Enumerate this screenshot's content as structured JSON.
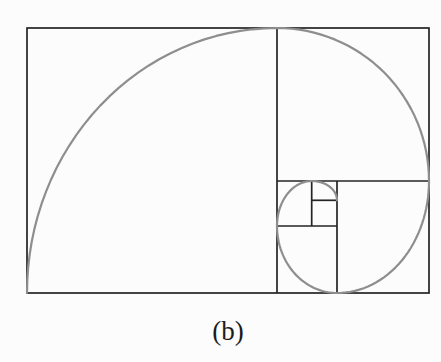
{
  "figure": {
    "caption": "(b)",
    "background": "#fcfcfc",
    "line_color": "#242424",
    "spiral_color": "#8e8e8e",
    "line_width": 1.7,
    "spiral_width": 2.2,
    "canvas": {
      "width": 441,
      "height": 310
    },
    "outer_rect": {
      "x": 27,
      "y": 28,
      "w": 402,
      "h": 265
    },
    "dividers": [
      {
        "x1": 277,
        "y1": 28,
        "x2": 277,
        "y2": 293
      },
      {
        "x1": 277,
        "y1": 181,
        "x2": 429,
        "y2": 181
      },
      {
        "x1": 337,
        "y1": 181,
        "x2": 337,
        "y2": 293
      },
      {
        "x1": 277,
        "y1": 226,
        "x2": 337,
        "y2": 226
      },
      {
        "x1": 311.7,
        "y1": 181,
        "x2": 311.7,
        "y2": 226
      },
      {
        "x1": 311.7,
        "y1": 200.3,
        "x2": 337,
        "y2": 200.3
      }
    ],
    "spiral_arcs": [
      {
        "cx": 277,
        "cy": 293,
        "rx": 250,
        "ry": 265,
        "a0": 180,
        "a1": 270
      },
      {
        "cx": 277,
        "cy": 181,
        "rx": 152,
        "ry": 153,
        "a0": 270,
        "a1": 360
      },
      {
        "cx": 337,
        "cy": 181,
        "rx": 92,
        "ry": 112,
        "a0": 0,
        "a1": 90
      },
      {
        "cx": 337,
        "cy": 226,
        "rx": 60,
        "ry": 67,
        "a0": 90,
        "a1": 180
      },
      {
        "cx": 311.7,
        "cy": 226,
        "rx": 34.7,
        "ry": 45,
        "a0": 180,
        "a1": 270
      },
      {
        "cx": 311.7,
        "cy": 200.3,
        "rx": 25.3,
        "ry": 19.3,
        "a0": 270,
        "a1": 360
      }
    ]
  }
}
